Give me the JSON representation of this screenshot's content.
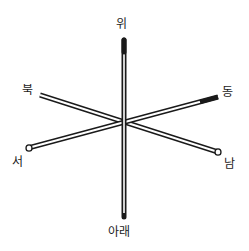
{
  "diagram": {
    "type": "3d-axes-rods",
    "labels": {
      "up": "위",
      "down": "아래",
      "north": "북",
      "south": "남",
      "east": "동",
      "west": "서"
    },
    "rods": [
      {
        "name": "vertical",
        "from": "up",
        "to": "down"
      },
      {
        "name": "north-south",
        "from": "north",
        "to": "south"
      },
      {
        "name": "west-east",
        "from": "west",
        "to": "east"
      }
    ],
    "colors": {
      "ink": "#1a1a1a",
      "background": "#ffffff"
    }
  }
}
